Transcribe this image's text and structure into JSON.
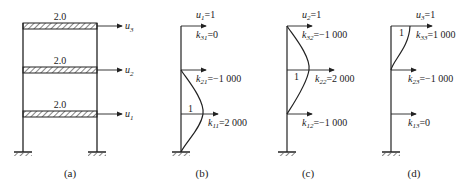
{
  "panel_a": {
    "caption": "(a)",
    "floors": [
      {
        "mass_label": "2.0",
        "dof": "u",
        "dof_sub": "3"
      },
      {
        "mass_label": "2.0",
        "dof": "u",
        "dof_sub": "2"
      },
      {
        "mass_label": "2.0",
        "dof": "u",
        "dof_sub": "1"
      }
    ]
  },
  "panel_b": {
    "caption": "(b)",
    "disp": {
      "sym": "u",
      "sub": "1",
      "val": "=1"
    },
    "unit_label": "1",
    "k": [
      {
        "sym": "k",
        "sub": "31",
        "val": "=0"
      },
      {
        "sym": "k",
        "sub": "21",
        "val": "=−1 000"
      },
      {
        "sym": "k",
        "sub": "11",
        "val": "=2 000"
      }
    ]
  },
  "panel_c": {
    "caption": "(c)",
    "disp": {
      "sym": "u",
      "sub": "2",
      "val": "=1"
    },
    "unit_label": "1",
    "k": [
      {
        "sym": "k",
        "sub": "32",
        "val": "=−1 000"
      },
      {
        "sym": "k",
        "sub": "22",
        "val": "=2 000"
      },
      {
        "sym": "k",
        "sub": "12",
        "val": "=−1 000"
      }
    ]
  },
  "panel_d": {
    "caption": "(d)",
    "disp": {
      "sym": "u",
      "sub": "3",
      "val": "=1"
    },
    "unit_label": "1",
    "k": [
      {
        "sym": "k",
        "sub": "33",
        "val": "=1 000"
      },
      {
        "sym": "k",
        "sub": "23",
        "val": "=−1 000"
      },
      {
        "sym": "k",
        "sub": "13",
        "val": "=0"
      }
    ]
  }
}
